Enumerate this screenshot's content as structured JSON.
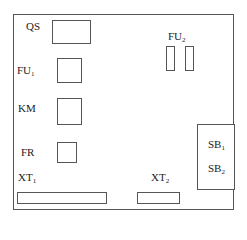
{
  "diagram": {
    "type": "electrical-panel-layout",
    "components": [
      {
        "id": "QS",
        "label": "QS",
        "sub": ""
      },
      {
        "id": "FU1",
        "label": "FU",
        "sub": "1"
      },
      {
        "id": "FU2",
        "label": "FU",
        "sub": "2"
      },
      {
        "id": "KM",
        "label": "KM",
        "sub": ""
      },
      {
        "id": "FR",
        "label": "FR",
        "sub": ""
      },
      {
        "id": "XT1",
        "label": "XT",
        "sub": "1"
      },
      {
        "id": "XT2",
        "label": "XT",
        "sub": "2"
      },
      {
        "id": "SB1",
        "label": "SB",
        "sub": "1"
      },
      {
        "id": "SB2",
        "label": "SB",
        "sub": "2"
      }
    ]
  }
}
